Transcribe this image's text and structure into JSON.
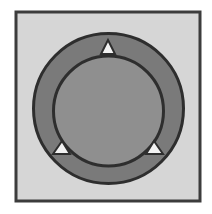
{
  "diagram": {
    "colors": {
      "page_background": "#ffffff",
      "frame_fill": "#d6d6d6",
      "frame_stroke": "#3c3c3c",
      "outer_ring_fill": "#7a7a7a",
      "inner_disc_fill": "#8f8f8f",
      "circle_stroke": "#2e2e2e",
      "marker_fill": "#f2f2f2",
      "marker_stroke": "#2e2e2e"
    },
    "frame": {
      "x": 16,
      "y": 12,
      "width": 184,
      "height": 189
    },
    "outer_circle": {
      "cx": 108.5,
      "cy": 108.5,
      "r": 75
    },
    "inner_circle": {
      "cx": 108.5,
      "cy": 111,
      "r": 55
    },
    "markers": [
      {
        "name": "top",
        "points": "108,40 101,54 115,54"
      },
      {
        "name": "bottom-left",
        "points": "62,141 53,154 70,154"
      },
      {
        "name": "bottom-right",
        "points": "154,141 146,154 163,154"
      }
    ]
  }
}
